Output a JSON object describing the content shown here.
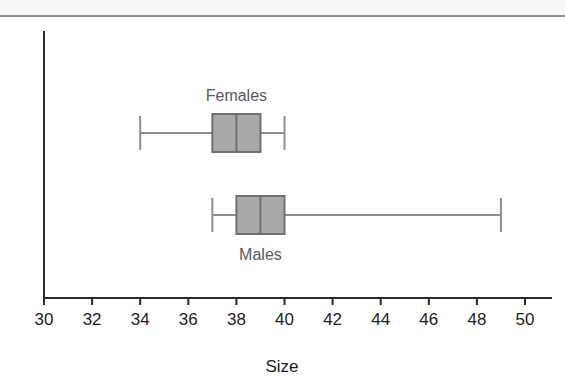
{
  "figure": {
    "background_color": "#ffffff",
    "top_band_color": "#f7f7f7",
    "rule_color": "#8d8f91"
  },
  "chart_data": {
    "type": "boxplot",
    "orientation": "horizontal",
    "title": "",
    "xlabel": "Size",
    "ylabel": "",
    "xlim": [
      30,
      50
    ],
    "xticks": [
      30,
      32,
      34,
      36,
      38,
      40,
      42,
      44,
      46,
      48,
      50
    ],
    "xtick_labels": [
      "30",
      "32",
      "34",
      "36",
      "38",
      "40",
      "42",
      "44",
      "46",
      "48",
      "50"
    ],
    "grid": false,
    "legend": "none",
    "box_fill_color": "#a9a9a9",
    "box_edge_color": "#6f7072",
    "whisker_color": "#8c8e90",
    "label_color": "#58595b",
    "axis_color": "#2b2b2b",
    "boxes": [
      {
        "name": "Females",
        "label": "Females",
        "label_position": "above",
        "min": 34,
        "q1": 37,
        "median": 38,
        "q3": 39,
        "max": 40
      },
      {
        "name": "Males",
        "label": "Males",
        "label_position": "below",
        "min": 37,
        "q1": 38,
        "median": 39,
        "q3": 40,
        "max": 49
      }
    ]
  }
}
